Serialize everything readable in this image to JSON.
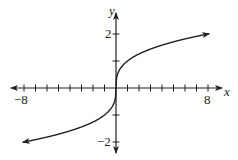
{
  "chart_data": {
    "type": "line",
    "title": "",
    "function": "y = cube root of x",
    "xlabel": "x",
    "ylabel": "y",
    "xlim": [
      -9,
      9
    ],
    "ylim": [
      -2.3,
      2.6
    ],
    "x_tick_labels": [
      "-8",
      "8"
    ],
    "y_tick_labels": [
      "2",
      "-2"
    ],
    "x_ticks": [
      -8,
      -7,
      -6,
      -5,
      -4,
      -3,
      -2,
      -1,
      1,
      2,
      3,
      4,
      5,
      6,
      7,
      8
    ],
    "y_ticks": [
      -2,
      -1,
      1,
      2
    ],
    "grid": false,
    "series": [
      {
        "name": "cube root",
        "x": [
          -8,
          -6,
          -4,
          -2,
          -1,
          -0.5,
          -0.1,
          0,
          0.1,
          0.5,
          1,
          2,
          4,
          6,
          8
        ],
        "values": [
          -2,
          -1.817,
          -1.587,
          -1.26,
          -1,
          -0.794,
          -0.464,
          0,
          0.464,
          0.794,
          1,
          1.26,
          1.587,
          1.817,
          2
        ]
      }
    ],
    "color": "#231f20"
  },
  "labels": {
    "x_axis": "x",
    "y_axis": "y",
    "x_min_label": "−8",
    "x_max_label": "8",
    "y_max_label": "2",
    "y_min_label": "−2"
  }
}
